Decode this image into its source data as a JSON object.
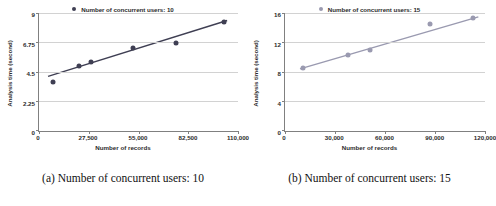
{
  "figure": {
    "panels": [
      {
        "caption": "(a) Number of concurrent users: 10",
        "legend_label": "Number of concurrent users: 10",
        "color": "#3f3f53",
        "chart_data": {
          "type": "scatter",
          "title": "",
          "legend": [
            "Number of concurrent users: 10"
          ],
          "legend_position": "top-center",
          "grid": true,
          "xlabel": "Number of records",
          "ylabel": "Analysis time (second)",
          "xlim": [
            0,
            110000
          ],
          "ylim": [
            0,
            9
          ],
          "xticks": [
            0,
            27500,
            55000,
            82500,
            110000
          ],
          "xticklabels": [
            "0",
            "27,500",
            "55,000",
            "82,500",
            "110,000"
          ],
          "yticks": [
            0,
            2.25,
            4.5,
            6.75,
            9
          ],
          "yticklabels": [
            "0",
            "2.25",
            "4.5",
            "6.75",
            "9"
          ],
          "x": [
            8000,
            22000,
            29000,
            52000,
            76000,
            102000
          ],
          "y": [
            3.75,
            5.0,
            5.3,
            6.35,
            6.8,
            8.4
          ],
          "trendline": {
            "x": [
              5000,
              104000
            ],
            "y": [
              4.2,
              8.5
            ]
          }
        }
      },
      {
        "caption": "(b) Number of concurrent users: 15",
        "legend_label": "Number of concurrent users: 15",
        "color": "#9a9ab0",
        "chart_data": {
          "type": "scatter",
          "title": "",
          "legend": [
            "Number of concurrent users: 15"
          ],
          "legend_position": "top-center",
          "grid": true,
          "xlabel": "Number of records",
          "ylabel": "Analysis time (second)",
          "xlim": [
            0,
            120000
          ],
          "ylim": [
            0,
            16
          ],
          "xticks": [
            0,
            30000,
            60000,
            90000,
            120000
          ],
          "xticklabels": [
            "0",
            "30,000",
            "60,000",
            "90,000",
            "120,000"
          ],
          "yticks": [
            0,
            4,
            8,
            12,
            16
          ],
          "yticklabels": [
            "0",
            "4",
            "8",
            "12",
            "16"
          ],
          "x": [
            11000,
            38000,
            51000,
            87000,
            113000
          ],
          "y": [
            8.6,
            10.4,
            11.1,
            14.6,
            15.4
          ],
          "trendline": {
            "x": [
              9000,
              116000
            ],
            "y": [
              8.5,
              15.6
            ]
          }
        }
      }
    ]
  }
}
